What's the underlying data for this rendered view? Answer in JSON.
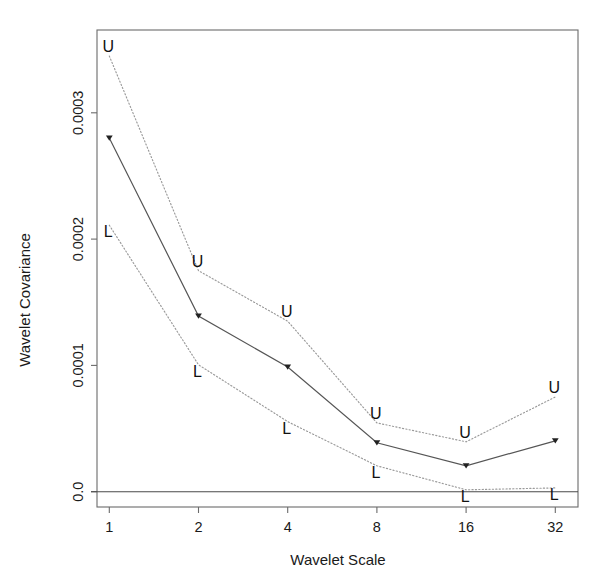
{
  "chart_data": {
    "type": "line",
    "title": "",
    "xlabel": "Wavelet Scale",
    "ylabel": "Wavelet Covariance",
    "categories": [
      "1",
      "2",
      "4",
      "8",
      "16",
      "32"
    ],
    "x": [
      1,
      2,
      4,
      8,
      16,
      32
    ],
    "x_scale": "log2",
    "xtick_labels": [
      "1",
      "2",
      "4",
      "8",
      "16",
      "32"
    ],
    "ytick_labels": [
      "0.0",
      "0.0001",
      "0.0002",
      "0.0003"
    ],
    "ytick_values": [
      0.0,
      0.0001,
      0.0002,
      0.0003
    ],
    "ylim": [
      -1.2e-05,
      0.000357
    ],
    "grid": false,
    "legend": "none",
    "point_labels": {
      "upper": "U",
      "lower": "L"
    },
    "series": [
      {
        "name": "Upper confidence bound",
        "label": "U",
        "style": "dotted",
        "values": [
          0.000345,
          0.000175,
          0.000135,
          5.45e-05,
          3.95e-05,
          7.5e-05
        ]
      },
      {
        "name": "Wavelet covariance estimate",
        "label": "",
        "style": "solid",
        "values": [
          0.00028,
          0.000139,
          9.87e-05,
          3.87e-05,
          2.05e-05,
          4.03e-05
        ]
      },
      {
        "name": "Lower confidence bound",
        "label": "L",
        "style": "dotted",
        "values": [
          0.000211,
          0.0001005,
          5.55e-05,
          2.05e-05,
          1.5e-06,
          3e-06
        ]
      }
    ],
    "zero_reference_line": 0.0,
    "colors": {
      "estimate": "#555555",
      "bounds": "#9a9a9a",
      "axis": "#6b6b6b",
      "text": "#1a1a1a",
      "background": "#ffffff"
    }
  }
}
